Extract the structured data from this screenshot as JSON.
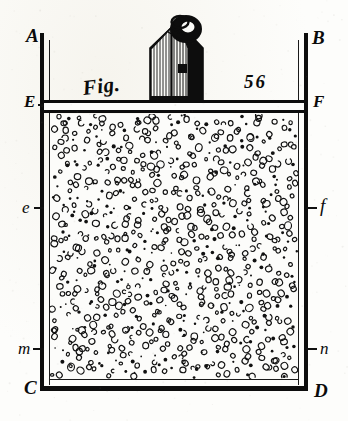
{
  "figure": {
    "caption_prefix": "Fig.",
    "number": "56",
    "title": "Fig. 56",
    "medium": "engraving",
    "ink_color": "#0d0d0d",
    "paper_color": "#fdfdfb"
  },
  "labels": {
    "top_left": "A",
    "top_right": "B",
    "bottom_left": "C",
    "bottom_right": "D",
    "lid_left": "E",
    "lid_right": "F",
    "mid_left": "e",
    "mid_right": "f",
    "low_left": "m",
    "low_right": "n"
  },
  "parts": {
    "vessel": "vessel-walls",
    "lid": "lid-piston-EF",
    "contents": "granular-fill",
    "load": "weight-with-ring-handle"
  }
}
